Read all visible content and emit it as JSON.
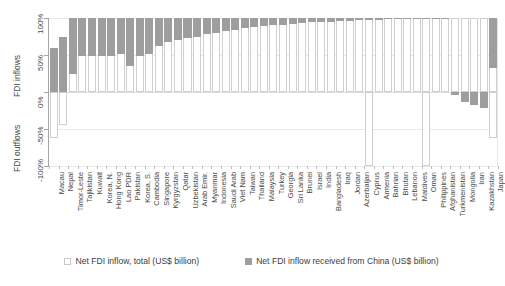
{
  "chart_data": {
    "type": "bar",
    "title": "",
    "subtitle": "",
    "xlabel": "",
    "ylabel_top": "FDI inflows",
    "ylabel_bottom": "FDI outflows",
    "ylim": [
      -100,
      100
    ],
    "yticks": [
      "100%",
      "50%",
      "0%",
      "-50%",
      "-100%"
    ],
    "ytick_values": [
      100,
      50,
      0,
      -50,
      -100
    ],
    "grid": true,
    "legend_position": "bottom",
    "legend": [
      "Net FDI inflow, total (US$ billion)",
      "Net FDI inflow received from China (US$ billion)"
    ],
    "categories": [
      "Macau",
      "Nepal",
      "Timor-Leste",
      "Tajikistan",
      "Kuwait",
      "Korea, N.",
      "Hong Kong",
      "Lao PDR",
      "Pakistan",
      "Korea, S.",
      "Cambodia",
      "Singapore",
      "Kyrgyzstan",
      "Qatar",
      "Uzbekistan",
      "Arab Emir.",
      "Myanmar",
      "Indonesia",
      "Saudi Arab",
      "Viet Nam",
      "Taiwan",
      "Thailand",
      "Malaysia",
      "Turkey",
      "Georgia",
      "Sri Lanka",
      "Brunei",
      "Israel",
      "India",
      "Bangladesh",
      "Iraq",
      "Jordan",
      "Azerbaijan",
      "Cyprus",
      "Armenia",
      "Bahrian",
      "Bhutan",
      "Lebanon",
      "Maldives",
      "Oman",
      "Philippines",
      "Afghanistan",
      "Turkmenistan",
      "Mongolia",
      "Iran",
      "Kazakhstan",
      "Japan"
    ],
    "series": [
      {
        "name": "Net FDI inflow, total (US$ billion)",
        "color": "#ffffff",
        "values": [
          60,
          75,
          100,
          100,
          100,
          100,
          100,
          100,
          100,
          100,
          100,
          100,
          100,
          100,
          100,
          100,
          100,
          100,
          100,
          100,
          100,
          100,
          100,
          100,
          100,
          100,
          100,
          100,
          100,
          100,
          100,
          100,
          100,
          100,
          100,
          100,
          100,
          100,
          100,
          100,
          100,
          100,
          100,
          100,
          100,
          100,
          100
        ],
        "negative_values": [
          -62,
          -44,
          0,
          0,
          0,
          0,
          0,
          0,
          0,
          0,
          0,
          0,
          0,
          0,
          0,
          0,
          0,
          0,
          0,
          0,
          0,
          0,
          0,
          0,
          0,
          0,
          0,
          0,
          0,
          0,
          0,
          0,
          0,
          -100,
          0,
          0,
          0,
          0,
          0,
          -100,
          0,
          0,
          0,
          0,
          0,
          0,
          -62
        ]
      },
      {
        "name": "Net FDI inflow received from China (US$ billion)",
        "color": "#9e9e9e",
        "values": [
          60,
          75,
          75,
          52,
          52,
          52,
          52,
          48,
          65,
          52,
          48,
          38,
          32,
          30,
          27,
          25,
          22,
          20,
          18,
          16,
          14,
          12,
          11,
          10,
          9,
          8,
          7,
          6,
          5,
          5,
          4,
          4,
          3,
          3,
          3,
          2,
          2,
          2,
          2,
          2,
          1,
          1,
          -4,
          -14,
          -18,
          -22,
          68
        ]
      }
    ]
  }
}
